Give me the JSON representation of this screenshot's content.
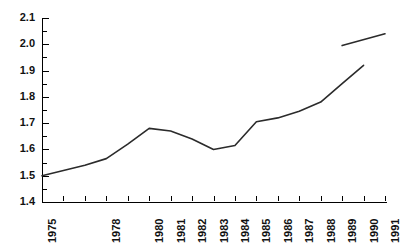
{
  "chart_data": {
    "type": "line",
    "title": "",
    "subtitle": "",
    "xlabel": "",
    "ylabel": "",
    "grid": false,
    "legend": "none",
    "xlim": [
      1975,
      1991
    ],
    "ylim": [
      1.4,
      2.1
    ],
    "y_ticks": [
      1.4,
      1.5,
      1.6,
      1.7,
      1.8,
      1.9,
      2.0,
      2.1
    ],
    "y_tick_labels": [
      "1.4",
      "1.5",
      "1.6",
      "1.7",
      "1.8",
      "1.9",
      "2.0",
      "2.1"
    ],
    "y_minor_tick_step": 0.05,
    "x_ticks": [
      1975,
      1976,
      1977,
      1978,
      1979,
      1980,
      1981,
      1982,
      1983,
      1984,
      1985,
      1986,
      1987,
      1988,
      1989,
      1990,
      1991
    ],
    "x_tick_labels": [
      "1975",
      "",
      "",
      "1978",
      "",
      "1980",
      "1981",
      "1982",
      "1983",
      "1984",
      "1985",
      "1986",
      "1987",
      "1988",
      "1989",
      "1990",
      "1991"
    ],
    "series": [
      {
        "name": "main",
        "x": [
          1975,
          1976,
          1977,
          1978,
          1979,
          1980,
          1981,
          1982,
          1983,
          1984,
          1985,
          1986,
          1987,
          1988,
          1989,
          1990
        ],
        "values": [
          1.5,
          1.52,
          1.54,
          1.565,
          1.62,
          1.68,
          1.67,
          1.64,
          1.6,
          1.615,
          1.705,
          1.72,
          1.745,
          1.78,
          1.85,
          1.92
        ]
      },
      {
        "name": "upper-segment",
        "x": [
          1989,
          1991
        ],
        "values": [
          1.995,
          2.04
        ]
      }
    ],
    "line_color": "#2b2b2b",
    "axis_color": "#000000",
    "background": "#ffffff"
  }
}
